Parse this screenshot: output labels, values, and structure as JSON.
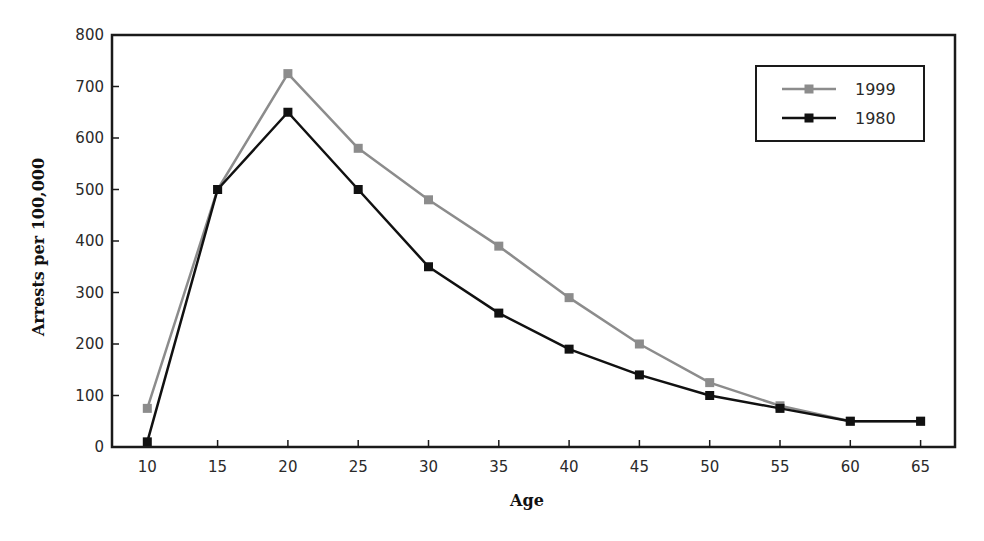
{
  "chart_data": {
    "type": "line",
    "title": "",
    "xlabel": "Age",
    "ylabel": "Arrests per 100,000",
    "x": [
      10,
      15,
      20,
      25,
      30,
      35,
      40,
      45,
      50,
      55,
      60,
      65
    ],
    "xticks": [
      "10",
      "15",
      "20",
      "25",
      "30",
      "35",
      "40",
      "45",
      "50",
      "55",
      "60",
      "65"
    ],
    "yticks": [
      "0",
      "100",
      "200",
      "300",
      "400",
      "500",
      "600",
      "700",
      "800"
    ],
    "ylim": [
      0,
      800
    ],
    "xlim": [
      7.5,
      67.5
    ],
    "grid": false,
    "legend_position": "upper right",
    "series": [
      {
        "name": "1999",
        "color": "#8c8c8c",
        "marker": "square",
        "values": [
          75,
          500,
          725,
          580,
          480,
          390,
          290,
          200,
          125,
          80,
          50,
          50
        ]
      },
      {
        "name": "1980",
        "color": "#111111",
        "marker": "square",
        "values": [
          10,
          500,
          650,
          500,
          350,
          260,
          190,
          140,
          100,
          75,
          50,
          50
        ]
      }
    ]
  }
}
